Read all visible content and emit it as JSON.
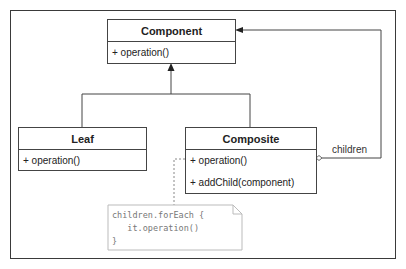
{
  "diagram": {
    "classes": {
      "component": {
        "name": "Component",
        "operations": [
          "+ operation()"
        ]
      },
      "leaf": {
        "name": "Leaf",
        "operations": [
          "+ operation()"
        ]
      },
      "composite": {
        "name": "Composite",
        "operations": [
          "+ operation()",
          "+ addChild(component)"
        ]
      }
    },
    "associations": {
      "children_label": "children"
    },
    "note": {
      "lines": [
        "children.forEach {",
        "   it.operation()",
        "}"
      ]
    },
    "colors": {
      "line": "#444444",
      "note_border": "#bbbbbb",
      "note_text": "#777777"
    }
  }
}
